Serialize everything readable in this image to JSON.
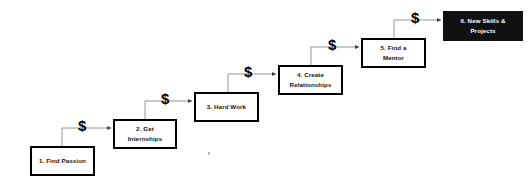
{
  "diagram": {
    "background_color": "#ffffff",
    "line_color": "#3d3d3d",
    "box_border_color": "#000000",
    "final_box_fill": "#111111",
    "final_box_text_color": "#ffffff",
    "steps": [
      {
        "id": "step-1",
        "label": "1. Find Passion",
        "lines": [
          "1. Find Passion"
        ],
        "highlighted": false,
        "x": 30,
        "y": 146,
        "w": 65,
        "h": 30
      },
      {
        "id": "step-2",
        "label": "2. Get Internships",
        "lines": [
          "2. Get",
          "Internships"
        ],
        "highlighted": false,
        "x": 113,
        "y": 119,
        "w": 64,
        "h": 30
      },
      {
        "id": "step-3",
        "label": "3. Hard Work",
        "lines": [
          "3. Hard Work"
        ],
        "highlighted": false,
        "x": 194,
        "y": 92,
        "w": 65,
        "h": 30
      },
      {
        "id": "step-4",
        "label": "4. Create Relationships",
        "lines": [
          "4. Create",
          "Relationships"
        ],
        "highlighted": false,
        "x": 278,
        "y": 65,
        "w": 65,
        "h": 30
      },
      {
        "id": "step-5",
        "label": "5. Find a Mentor",
        "lines": [
          "5. Find a",
          "Mentor"
        ],
        "highlighted": false,
        "x": 361,
        "y": 38,
        "w": 65,
        "h": 30
      },
      {
        "id": "step-6",
        "label": "6. New Skills & Projects",
        "lines": [
          "6. New Skills &",
          "Projects"
        ],
        "highlighted": true,
        "x": 443,
        "y": 11,
        "w": 80,
        "h": 30
      }
    ],
    "connectors": [
      {
        "id": "connector-1-2",
        "from": "step-1",
        "to": "step-2",
        "symbol": "$",
        "symbol_x": 78,
        "symbol_y": 118
      },
      {
        "id": "connector-2-3",
        "from": "step-2",
        "to": "step-3",
        "symbol": "$",
        "symbol_x": 161,
        "symbol_y": 91
      },
      {
        "id": "connector-3-4",
        "from": "step-3",
        "to": "step-4",
        "symbol": "$",
        "symbol_x": 244,
        "symbol_y": 64
      },
      {
        "id": "connector-4-5",
        "from": "step-4",
        "to": "step-5",
        "symbol": "$",
        "symbol_x": 328,
        "symbol_y": 37
      },
      {
        "id": "connector-5-6",
        "from": "step-5",
        "to": "step-6",
        "symbol": "$",
        "symbol_x": 411,
        "symbol_y": 10
      }
    ]
  }
}
